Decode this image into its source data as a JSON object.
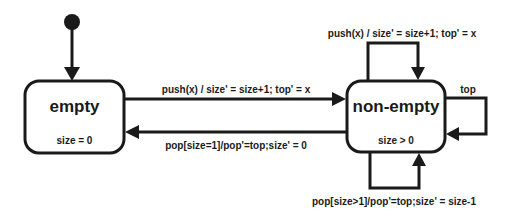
{
  "diagram": {
    "type": "state-machine",
    "initial_state": "empty",
    "states": [
      {
        "id": "empty",
        "title": "empty",
        "invariant": "size = 0"
      },
      {
        "id": "non-empty",
        "title": "non-empty",
        "invariant": "size > 0"
      }
    ],
    "transitions": [
      {
        "from": "initial",
        "to": "empty",
        "label": ""
      },
      {
        "from": "empty",
        "to": "non-empty",
        "label": "push(x) / size' = size+1; top' = x"
      },
      {
        "from": "non-empty",
        "to": "empty",
        "label": "pop[size=1]/pop'=top;size' = 0"
      },
      {
        "from": "non-empty",
        "to": "non-empty",
        "label": "push(x) / size' = size+1; top' = x"
      },
      {
        "from": "non-empty",
        "to": "non-empty",
        "label": "top"
      },
      {
        "from": "non-empty",
        "to": "non-empty",
        "label": "pop[size>1]/pop'=top;size' = size-1"
      }
    ],
    "colors": {
      "stroke": "#1a1a1a",
      "background": "#ffffff"
    }
  }
}
